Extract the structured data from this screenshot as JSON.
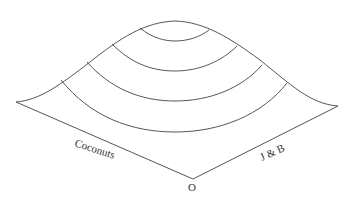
{
  "diagram": {
    "type": "3D surface with contour lines (utility hill)",
    "labels": {
      "x_axis": "Coconuts",
      "y_axis": "J & B",
      "origin": "O"
    },
    "contour_count": 4,
    "colors": {
      "line": "#555555",
      "text": "#333333",
      "background": "#ffffff"
    }
  }
}
